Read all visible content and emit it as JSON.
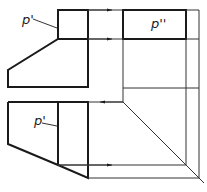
{
  "figure": {
    "type": "orthographic-projection",
    "labels": {
      "front_view_point": "p'",
      "side_view_point": "p''",
      "top_view_point": "p'"
    },
    "colors": {
      "line": "#1a1a1a",
      "background": "#ffffff"
    }
  }
}
